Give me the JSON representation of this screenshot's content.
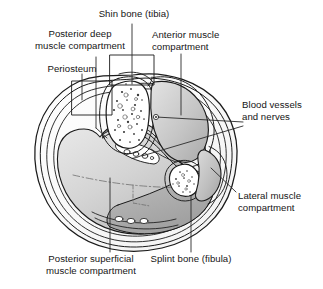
{
  "figure": {
    "type": "anatomical-cross-section",
    "background_color": "#ffffff",
    "line_color": "#1a1a1a",
    "text_color": "#151515"
  },
  "labels": {
    "shin_bone": "Shin bone (tibia)",
    "posterior_deep": "Posterior deep\nmuscle compartment",
    "periosteum": "Periosteum",
    "anterior": "Anterior muscle\ncompartment",
    "blood_vessels": "Blood vessels\nand nerves",
    "lateral": "Lateral muscle\ncompartment",
    "posterior_superficial": "Posterior superficial\nmuscle compartment",
    "splint_bone": "Splint bone (fibula)"
  },
  "structures": {
    "tibia": {
      "name": "tibia",
      "fill": "#ffffff",
      "marrow": "speckled"
    },
    "fibula": {
      "name": "fibula",
      "fill": "#ffffff",
      "marrow": "speckled"
    },
    "anterior_compartment": {
      "name": "anterior muscle compartment",
      "fill": "#c9c9c9"
    },
    "lateral_compartment": {
      "name": "lateral muscle compartment",
      "fill": "#bfbfbf"
    },
    "posterior_deep_compartment": {
      "name": "posterior deep muscle compartment",
      "fill": "#c4c4c4"
    },
    "posterior_superficial_compartment": {
      "name": "posterior superficial muscle compartment",
      "fill": "#d2d2d2"
    },
    "periosteum": {
      "name": "periosteum",
      "fill": "#ffffff"
    },
    "neurovascular_bundles": {
      "name": "blood vessels and nerves",
      "fill": "#ffffff"
    },
    "skin_fascia": {
      "name": "skin and fascia envelope",
      "fill": "#ffffff"
    }
  }
}
